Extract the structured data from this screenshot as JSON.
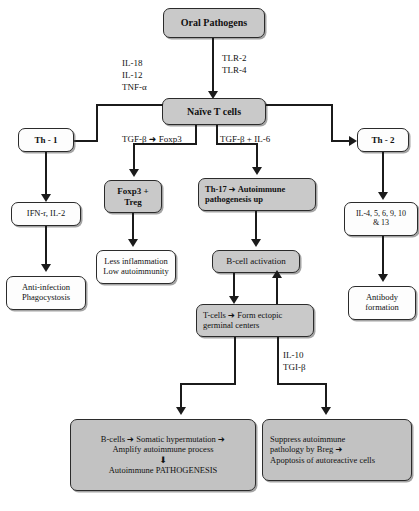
{
  "figure": {
    "type": "flowchart"
  },
  "nodes": {
    "oral_pathogens": "Oral Pathogens",
    "naive_t_cells": "Naïve T cells",
    "th1": "Th - 1",
    "th2": "Th - 2",
    "ifn_il2": "IFN-r, IL-2",
    "anti_infection_l1": "Anti-infection",
    "anti_infection_l2": "Phagocystosis",
    "foxp3_treg_l1": "Foxp3 +",
    "foxp3_treg_l2": "Treg",
    "less_inflam_l1": "Less inflammation",
    "less_inflam_l2": "Low autoimmunity",
    "th17_l1_a": "Th-17",
    "th17_l1_b": "Autoimmune",
    "th17_l2": "pathogenesis up",
    "bcell_activation": "B-cell activation",
    "tcells_l1_a": "T-cells",
    "tcells_l1_b": "Form ectopic",
    "tcells_l2": "germinal centers",
    "il4_series_l1": "IL-4, 5, 6, 9, 10",
    "il4_series_l2": "& 13",
    "antibody_l1": "Antibody",
    "antibody_l2": "formation",
    "bottom_left_l1_a": "B-cells",
    "bottom_left_l1_b": "Somatic hypermutation",
    "bottom_left_l2": "Amplify autoimmune process",
    "bottom_left_l3": "Autoimmune PATHOGENESIS",
    "bottom_right_l1": "Suppress autoimmune",
    "bottom_right_l2": "pathology by Breg",
    "bottom_right_l3": "Apoptosis of autoreactive cells"
  },
  "edge_labels": {
    "tlr_1": "TLR-2",
    "tlr_2": "TLR-4",
    "il18": "IL-18",
    "il12": "IL-12",
    "tnfa": "TNF-α",
    "tgfb_foxp3_a": "TGF-β",
    "tgfb_foxp3_b": "Foxp3",
    "tgfb_il6": "TGF-β + IL-6",
    "il10": "IL-10",
    "tgib": "TGI-β"
  },
  "glyphs": {
    "right_arrow": "➜",
    "down_arrow": "⬇"
  },
  "colors": {
    "box_stroke": "#2b2b2b",
    "box_gray": "#c9c9c9",
    "box_white": "#fdfdfd",
    "connector": "#1b1b1b",
    "text": "#111111"
  }
}
